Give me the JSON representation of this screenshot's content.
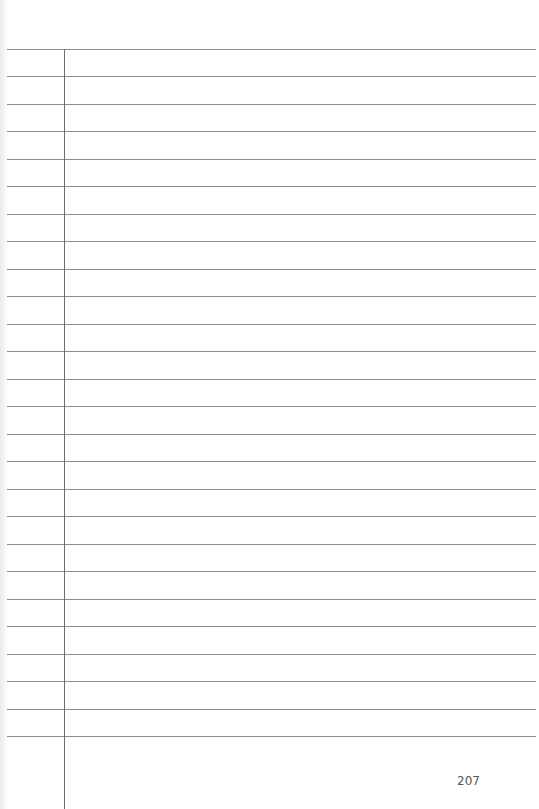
{
  "page": {
    "type": "lined-notebook-page",
    "line_count": 26,
    "first_line_y": 49,
    "line_spacing": 27.48,
    "margin_line_x": 64,
    "line_color": "#8c8c8c",
    "margin_color": "#6e6e6e",
    "page_number": "207"
  }
}
